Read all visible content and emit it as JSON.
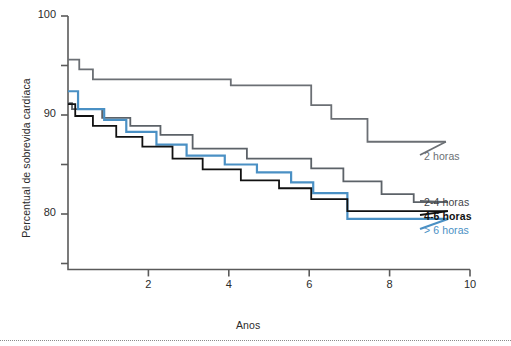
{
  "chart_data": {
    "type": "line",
    "title": "",
    "xlabel": "Anos",
    "ylabel": "Percentual de sobrevida cardíaca",
    "xlim": [
      0,
      10
    ],
    "ylim": [
      75,
      100
    ],
    "grid": false,
    "legend_position": "right-inline",
    "x_ticks": [
      {
        "value": 2,
        "label": "2"
      },
      {
        "value": 4,
        "label": "4"
      },
      {
        "value": 6,
        "label": "6"
      },
      {
        "value": 8,
        "label": "8"
      },
      {
        "value": 10,
        "label": "10"
      }
    ],
    "x_minor_ticks": [],
    "y_ticks": [
      {
        "value": 100,
        "label": "100"
      },
      {
        "value": 90,
        "label": "90"
      },
      {
        "value": 80,
        "label": "80"
      }
    ],
    "y_minor_ticks": [
      95,
      85,
      75
    ],
    "series": [
      {
        "name": "2 horas",
        "color": "#6b6f74",
        "width": 1.8,
        "label_color": "#6b6f74",
        "label_weight": "400",
        "label_x": 424,
        "label_y": 150,
        "points": [
          [
            0.0,
            95.6
          ],
          [
            0.28,
            95.6
          ],
          [
            0.28,
            94.6
          ],
          [
            0.62,
            94.6
          ],
          [
            0.62,
            93.6
          ],
          [
            4.05,
            93.6
          ],
          [
            4.05,
            93.0
          ],
          [
            6.05,
            93.0
          ],
          [
            6.05,
            91.0
          ],
          [
            6.55,
            91.0
          ],
          [
            6.55,
            89.6
          ],
          [
            7.45,
            89.6
          ],
          [
            7.45,
            87.3
          ],
          [
            9.4,
            87.3
          ]
        ]
      },
      {
        "name": "2-4 horas",
        "color": "#5c6268",
        "width": 1.8,
        "label_color": "#3f4449",
        "label_weight": "400",
        "label_x": 424,
        "label_y": 196,
        "points": [
          [
            0.0,
            91.2
          ],
          [
            0.1,
            91.2
          ],
          [
            0.1,
            90.6
          ],
          [
            0.85,
            90.6
          ],
          [
            0.85,
            89.7
          ],
          [
            1.55,
            89.7
          ],
          [
            1.55,
            88.9
          ],
          [
            2.3,
            88.9
          ],
          [
            2.3,
            88.0
          ],
          [
            3.1,
            88.0
          ],
          [
            3.1,
            86.6
          ],
          [
            4.45,
            86.6
          ],
          [
            4.45,
            85.6
          ],
          [
            6.05,
            85.6
          ],
          [
            6.05,
            84.6
          ],
          [
            6.85,
            84.6
          ],
          [
            6.85,
            83.3
          ],
          [
            7.8,
            83.3
          ],
          [
            7.8,
            82.0
          ],
          [
            8.6,
            82.0
          ],
          [
            8.6,
            81.2
          ],
          [
            9.45,
            81.2
          ]
        ]
      },
      {
        "name": "4-6 horas",
        "color": "#111111",
        "width": 1.8,
        "label_color": "#111111",
        "label_weight": "700",
        "label_x": 424,
        "label_y": 210,
        "points": [
          [
            0.0,
            91.1
          ],
          [
            0.18,
            91.1
          ],
          [
            0.18,
            89.9
          ],
          [
            0.62,
            89.9
          ],
          [
            0.62,
            88.9
          ],
          [
            1.2,
            88.9
          ],
          [
            1.2,
            87.8
          ],
          [
            1.85,
            87.8
          ],
          [
            1.85,
            86.8
          ],
          [
            2.6,
            86.8
          ],
          [
            2.6,
            85.6
          ],
          [
            3.35,
            85.6
          ],
          [
            3.35,
            84.5
          ],
          [
            4.3,
            84.5
          ],
          [
            4.3,
            83.4
          ],
          [
            5.25,
            83.4
          ],
          [
            5.25,
            82.6
          ],
          [
            6.05,
            82.6
          ],
          [
            6.05,
            81.5
          ],
          [
            6.95,
            81.5
          ],
          [
            6.95,
            80.3
          ],
          [
            9.45,
            80.3
          ]
        ]
      },
      {
        "name": "> 6 horas",
        "color": "#4a90c4",
        "width": 2.2,
        "label_color": "#4a90c4",
        "label_weight": "400",
        "label_x": 424,
        "label_y": 224,
        "points": [
          [
            0.0,
            92.4
          ],
          [
            0.25,
            92.4
          ],
          [
            0.25,
            90.6
          ],
          [
            0.9,
            90.6
          ],
          [
            0.9,
            89.5
          ],
          [
            1.45,
            89.5
          ],
          [
            1.45,
            88.3
          ],
          [
            2.2,
            88.3
          ],
          [
            2.2,
            87.0
          ],
          [
            2.95,
            87.0
          ],
          [
            2.95,
            85.9
          ],
          [
            3.9,
            85.9
          ],
          [
            3.9,
            85.0
          ],
          [
            4.7,
            85.0
          ],
          [
            4.7,
            84.2
          ],
          [
            5.55,
            84.2
          ],
          [
            5.55,
            83.2
          ],
          [
            6.1,
            83.2
          ],
          [
            6.1,
            82.1
          ],
          [
            6.95,
            82.1
          ],
          [
            6.95,
            79.5
          ],
          [
            9.45,
            79.5
          ]
        ]
      }
    ]
  },
  "axes": {
    "y_title": "Percentual de sobrevida cardíaca",
    "x_title": "Anos"
  },
  "legend": {
    "items": [
      {
        "label": "2 horas"
      },
      {
        "label": "2-4 horas"
      },
      {
        "label": "4-6 horas"
      },
      {
        "label": "> 6 horas"
      }
    ]
  },
  "style": {
    "axis_color": "#5a5a5a",
    "text_color": "#2b2b2b",
    "background": "#ffffff",
    "accent_blue": "#4a90c4"
  }
}
